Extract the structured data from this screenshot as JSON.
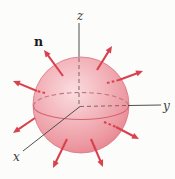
{
  "figure": {
    "background": "#fcfcfa",
    "labels": {
      "normal_vector": "n",
      "axis_z": "z",
      "axis_y": "y",
      "axis_x": "x"
    },
    "colors": {
      "arrow_red": "#d8414e",
      "sphere_highlight": "#fadde0",
      "sphere_mid": "#f3b6bc",
      "sphere_rim": "#e47f8a",
      "sphere_outline": "#d97580",
      "axis": "#4f4f4f",
      "hidden_dash": "#7d6668",
      "equator_front": "#d4646f",
      "equator_back": "#c4737a"
    },
    "sphere": {
      "cx": 81,
      "cy": 105,
      "r": 48
    },
    "arrows": [
      {
        "x1": 63,
        "y1": 76,
        "x2": 44,
        "y2": 50
      },
      {
        "x1": 97,
        "y1": 70,
        "x2": 112,
        "y2": 46
      },
      {
        "x1": 119,
        "y1": 80,
        "x2": 143,
        "y2": 71,
        "tail": [
          107,
          83,
          119,
          80
        ]
      },
      {
        "x1": 37,
        "y1": 91,
        "x2": 13,
        "y2": 81,
        "tail": [
          45,
          93,
          37,
          91
        ]
      },
      {
        "x1": 116,
        "y1": 127,
        "x2": 139,
        "y2": 139,
        "tail": [
          104,
          122,
          116,
          127
        ]
      },
      {
        "x1": 35,
        "y1": 118,
        "x2": 13,
        "y2": 133
      },
      {
        "x1": 67,
        "y1": 139,
        "x2": 53,
        "y2": 168
      },
      {
        "x1": 91,
        "y1": 139,
        "x2": 103,
        "y2": 167
      }
    ]
  }
}
